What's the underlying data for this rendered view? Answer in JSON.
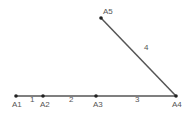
{
  "colors": {
    "line": "#555555",
    "point": "#222222",
    "label": "#555555"
  },
  "points": [
    {
      "id": "A1",
      "x": 16,
      "y": 96,
      "lx": 12,
      "ly": 107
    },
    {
      "id": "A2",
      "x": 43,
      "y": 96,
      "lx": 40,
      "ly": 107
    },
    {
      "id": "A3",
      "x": 96,
      "y": 96,
      "lx": 93,
      "ly": 107
    },
    {
      "id": "A4",
      "x": 176,
      "y": 96,
      "lx": 172,
      "ly": 107
    },
    {
      "id": "A5",
      "x": 101,
      "y": 18,
      "lx": 103,
      "ly": 14
    }
  ],
  "segments": [
    {
      "label": "1",
      "from": 0,
      "to": 1,
      "lx": 30,
      "ly": 102
    },
    {
      "label": "2",
      "from": 1,
      "to": 2,
      "lx": 69,
      "ly": 102
    },
    {
      "label": "3",
      "from": 2,
      "to": 3,
      "lx": 135,
      "ly": 102
    },
    {
      "label": "4",
      "from": 4,
      "to": 3,
      "lx": 144,
      "ly": 50
    }
  ]
}
